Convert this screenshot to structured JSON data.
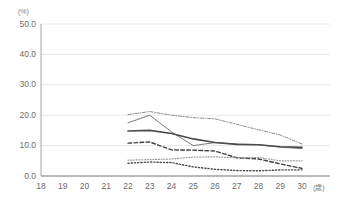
{
  "chart_data": {
    "type": "line",
    "title": "",
    "xlabel": "(歳)",
    "ylabel": "(%)",
    "x": [
      18,
      19,
      20,
      21,
      22,
      23,
      24,
      25,
      26,
      27,
      28,
      29,
      30
    ],
    "xlim": [
      18,
      30
    ],
    "ylim": [
      0,
      50
    ],
    "yticks": [
      "0.0",
      "10.0",
      "20.0",
      "30.0",
      "40.0",
      "50.0"
    ],
    "ytick_values": [
      0,
      10,
      20,
      30,
      40,
      50
    ],
    "xticks": [
      "18",
      "19",
      "20",
      "21",
      "22",
      "23",
      "24",
      "25",
      "26",
      "27",
      "28",
      "29",
      "30"
    ],
    "grid": true,
    "grid_axis": "y",
    "legend": "none",
    "series": [
      {
        "name": "series-1-dashdot-upper",
        "style": "dashdot",
        "color": "#8c8c8c",
        "width": 1,
        "x": [
          22,
          23,
          24,
          25,
          26,
          27,
          28,
          29,
          30
        ],
        "values": [
          20.2,
          21.2,
          20.0,
          19.2,
          18.8,
          17.0,
          15.2,
          13.5,
          10.5
        ]
      },
      {
        "name": "series-2-solid-thin",
        "style": "solid",
        "color": "#7a7a7a",
        "width": 1,
        "x": [
          22,
          23,
          24,
          25,
          26,
          27,
          28,
          29,
          30
        ],
        "values": [
          17.5,
          20.0,
          14.5,
          10.0,
          11.0,
          10.5,
          10.3,
          9.5,
          9.0
        ]
      },
      {
        "name": "series-3-solid-thick",
        "style": "solid",
        "color": "#4a4a4a",
        "width": 1.6,
        "x": [
          22,
          23,
          24,
          25,
          26,
          27,
          28,
          29,
          30
        ],
        "values": [
          14.8,
          15.0,
          14.0,
          12.2,
          11.0,
          10.4,
          10.3,
          9.6,
          9.4
        ]
      },
      {
        "name": "series-4-dashed",
        "style": "dashed",
        "color": "#3f3f3f",
        "width": 1.4,
        "x": [
          22,
          23,
          24,
          25,
          26,
          27,
          28,
          29,
          30
        ],
        "values": [
          10.8,
          11.2,
          8.6,
          8.5,
          8.2,
          6.0,
          5.6,
          4.0,
          2.5
        ]
      },
      {
        "name": "series-5-dotted-fine",
        "style": "dotted",
        "color": "#9a9a9a",
        "width": 1.2,
        "x": [
          22,
          23,
          24,
          25,
          26,
          27,
          28,
          29,
          30
        ],
        "values": [
          5.2,
          5.4,
          5.6,
          6.2,
          6.3,
          6.0,
          6.1,
          5.0,
          5.0
        ]
      },
      {
        "name": "series-6-dotted-lower",
        "style": "dotted",
        "color": "#4a4a4a",
        "width": 1.4,
        "x": [
          22,
          23,
          24,
          25,
          26,
          27,
          28,
          29,
          30
        ],
        "values": [
          4.2,
          4.6,
          4.4,
          3.0,
          2.2,
          1.8,
          1.7,
          2.0,
          2.0
        ]
      }
    ]
  },
  "colors": {
    "axis": "#9a9a9a",
    "grid": "#e2e2e2",
    "tick_text": "#6b6b6b",
    "unit_text": "#808080",
    "background": "#ffffff"
  }
}
